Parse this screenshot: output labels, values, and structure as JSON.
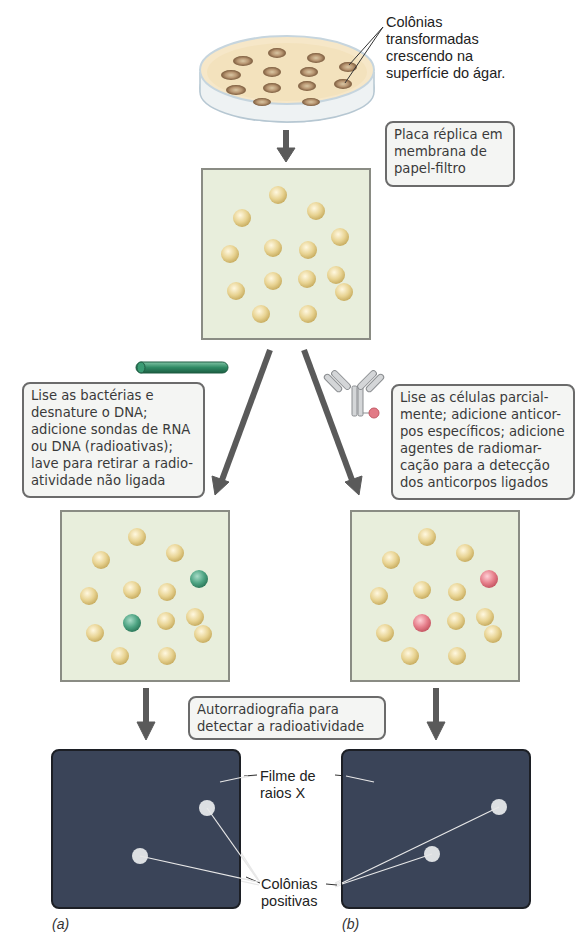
{
  "top": {
    "callout": "Colônias\ntransformadas\ncrescendo na\nsuperfície do ágar."
  },
  "replica_box": "Placa réplica em\nmembrana de\npapel-filtro",
  "left_box": "Lise as bactérias e\ndesnature o DNA;\nadicione sondas de RNA\nou DNA (radioativas);\nlave para retirar a radio-\natividade não ligada",
  "right_box": "Lise as células parcial-\nmente; adicione anticor-\npos específicos; adicione\nagentes de radiomar-\ncação para a detecção\ndos anticorpos ligados",
  "autoradiography_box": "Autorradiografia para\ndetectar a radioatividade",
  "film_label": "Filme de\nraios X",
  "positive_label": "Colônias\npositivas",
  "panel_a": "(a)",
  "panel_b": "(b)",
  "colors": {
    "colony": "#e3cf8c",
    "probe_positive": "#3f9a78",
    "antibody_positive": "#e27a86",
    "film": "#3a4458",
    "arrow": "#5a5a5a"
  }
}
